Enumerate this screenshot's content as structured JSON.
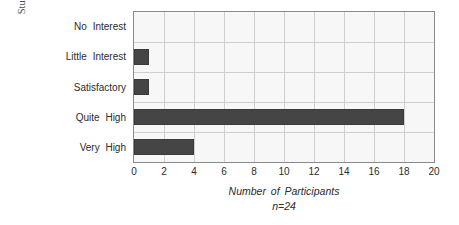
{
  "chart_data": {
    "type": "bar",
    "orientation": "horizontal",
    "title": "",
    "xlabel": "Number of Participants",
    "sublabel": "n=24",
    "ylabel_line1": "Student ownership",
    "ylabel_line2": "of activities",
    "categories": [
      "No  Interest",
      "Little  Interest",
      "Satisfactory",
      "Quite  High",
      "Very  High"
    ],
    "values": [
      0,
      1,
      1,
      18,
      4
    ],
    "xlim": [
      0,
      20
    ],
    "xticks": [
      0,
      2,
      4,
      6,
      8,
      10,
      12,
      14,
      16,
      18,
      20
    ],
    "xticklabels": [
      "0",
      "2",
      "4",
      "6",
      "8",
      "10",
      "12",
      "14",
      "16",
      "18",
      "20"
    ],
    "grid": true,
    "legend": "none",
    "bar_color": "#454545",
    "plot_background": "#f7f7f7",
    "grid_color": "#cfcfcf",
    "axis_color": "#8a8a8a"
  }
}
